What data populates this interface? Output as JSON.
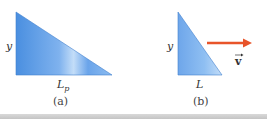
{
  "figure": {
    "panel_a": {
      "side_label": "y",
      "base_label": "L",
      "base_subscript": "p",
      "caption": "(a)"
    },
    "panel_b": {
      "side_label": "y",
      "base_label": "L",
      "caption": "(b)",
      "velocity_label": "v",
      "velocity_arrow_symbol": "→"
    },
    "colors": {
      "triangle_fill_dark": "#4a8fe0",
      "triangle_fill_light": "#bcd8f7",
      "arrow": "#e8542a"
    }
  }
}
